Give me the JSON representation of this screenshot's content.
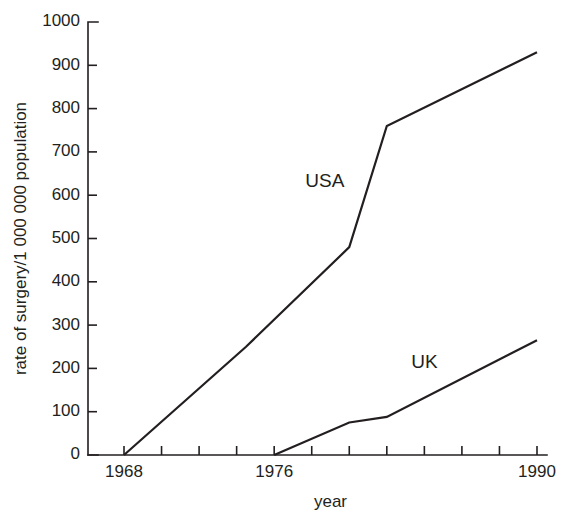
{
  "chart_data": {
    "type": "line",
    "title": "",
    "xlabel": "year",
    "ylabel": "rate of surgery/1 000 000 population",
    "xlim": [
      1968,
      1990
    ],
    "ylim": [
      0,
      1000
    ],
    "grid": false,
    "legend_position": "inline-annotations",
    "x_ticks": [
      1968,
      1970,
      1972,
      1974,
      1976,
      1978,
      1980,
      1982,
      1984,
      1986,
      1988,
      1990
    ],
    "x_tick_labels": [
      "1968",
      "",
      "",
      "",
      "1976",
      "",
      "",
      "",
      "",
      "",
      "",
      "1990"
    ],
    "y_ticks": [
      0,
      100,
      200,
      300,
      400,
      500,
      600,
      700,
      800,
      900,
      1000
    ],
    "y_tick_labels": [
      "0",
      "100",
      "200",
      "300",
      "400",
      "500",
      "600",
      "700",
      "800",
      "900",
      "1000"
    ],
    "series": [
      {
        "name": "USA",
        "label_text": "USA",
        "color": "#231f20",
        "x": [
          1968,
          1974.5,
          1980,
          1982,
          1990
        ],
        "values": [
          0,
          250,
          480,
          760,
          930
        ]
      },
      {
        "name": "UK",
        "label_text": "UK",
        "color": "#231f20",
        "x": [
          1976,
          1980,
          1982,
          1990
        ],
        "values": [
          0,
          75,
          88,
          265
        ]
      }
    ],
    "annotations": [
      {
        "text": "USA",
        "x": 1978.7,
        "y": 620
      },
      {
        "text": "UK",
        "x": 1984.0,
        "y": 200
      }
    ]
  }
}
